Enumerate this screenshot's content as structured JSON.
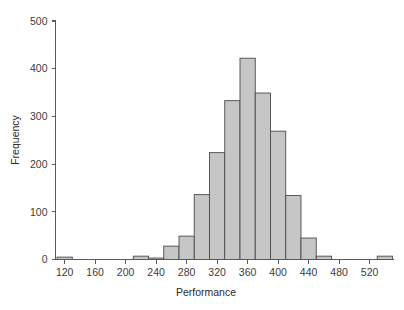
{
  "chart_data": {
    "type": "bar",
    "title": "",
    "subtitle": "",
    "xlabel": "Performance",
    "ylabel": "Frequency",
    "xlim": [
      108,
      552
    ],
    "ylim": [
      0,
      500
    ],
    "grid": false,
    "legend": null,
    "bin_width": 20,
    "x_ticks": [
      120,
      160,
      200,
      240,
      280,
      320,
      360,
      400,
      440,
      480,
      520
    ],
    "x_tick_labels": [
      "120",
      "160",
      "200",
      "240",
      "280",
      "320",
      "360",
      "400",
      "440",
      "480",
      "520"
    ],
    "y_ticks": [
      0,
      100,
      200,
      300,
      400,
      500
    ],
    "y_tick_labels": [
      "0",
      "100",
      "200",
      "300",
      "400",
      "500"
    ],
    "bin_starts": [
      110,
      130,
      150,
      170,
      190,
      210,
      230,
      250,
      270,
      290,
      310,
      330,
      350,
      370,
      390,
      410,
      430,
      450,
      470,
      490,
      510,
      530
    ],
    "bin_ends": [
      130,
      150,
      170,
      190,
      210,
      230,
      250,
      270,
      290,
      310,
      330,
      350,
      370,
      390,
      410,
      430,
      450,
      470,
      490,
      510,
      530,
      550
    ],
    "bin_centers": [
      120,
      140,
      160,
      180,
      200,
      220,
      240,
      260,
      280,
      300,
      320,
      340,
      360,
      380,
      400,
      420,
      440,
      460,
      480,
      500,
      520,
      540
    ],
    "categories": [
      "110-130",
      "130-150",
      "150-170",
      "170-190",
      "190-210",
      "210-230",
      "230-250",
      "250-270",
      "270-290",
      "290-310",
      "310-330",
      "330-350",
      "350-370",
      "370-390",
      "390-410",
      "410-430",
      "430-450",
      "450-470",
      "470-490",
      "490-510",
      "510-530",
      "530-550"
    ],
    "values": [
      5,
      0,
      0,
      0,
      0,
      7,
      3,
      28,
      49,
      136,
      224,
      333,
      422,
      349,
      269,
      134,
      45,
      7,
      0,
      0,
      0,
      7
    ],
    "series": [
      {
        "name": "Frequency",
        "values": [
          5,
          0,
          0,
          0,
          0,
          7,
          3,
          28,
          49,
          136,
          224,
          333,
          422,
          349,
          269,
          134,
          45,
          7,
          0,
          0,
          0,
          7
        ]
      }
    ],
    "bar_fill_color": "#c6c6c6",
    "bar_edge_color": "#4a4a4a",
    "axis_color": "#5a5a5a",
    "text_color": "#3b3b3b",
    "background_color": "#ffffff"
  },
  "axes": {
    "x_title": "Performance",
    "y_title": "Frequency"
  }
}
